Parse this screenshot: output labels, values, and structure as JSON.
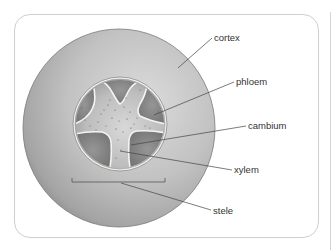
{
  "diagram": {
    "labels": {
      "cortex": "cortex",
      "phloem": "phloem",
      "cambium": "cambium",
      "xylem": "xylem",
      "stele": "stele"
    },
    "colors": {
      "frame_border": "#cfcfcf",
      "cortex_light": "#dcdcdc",
      "cortex_mid": "#bdbdbd",
      "cortex_edge": "#8f8f8f",
      "stele_ring": "#f2f2ee",
      "phloem": "#8c8c8c",
      "phloem_dark": "#6f6f6f",
      "xylem_light": "#d2d2d2",
      "xylem_dark": "#a9a9a9",
      "leader_line": "#444444",
      "label_text": "#333333"
    }
  }
}
